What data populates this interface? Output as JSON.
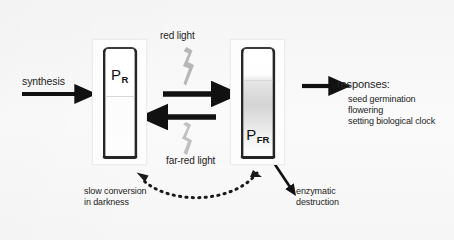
{
  "figure": {
    "background_color": "#f7f7f7"
  },
  "labels": {
    "synthesis": "synthesis",
    "red_light": "red light",
    "far_red_light": "far-red light",
    "slow_conversion_line1": "slow conversion",
    "slow_conversion_line2": "in darkness",
    "enzymatic_line1": "enzymatic",
    "enzymatic_line2": "destruction",
    "responses_heading": "responses:",
    "responses_items": [
      "seed germination",
      "flowering",
      "setting biological clock"
    ]
  },
  "tubes": [
    {
      "id": "pr",
      "symbol": "P",
      "subscript": "R",
      "name": "phytochrome-red-tube"
    },
    {
      "id": "pfr",
      "symbol": "P",
      "subscript": "FR",
      "name": "phytochrome-far-red-tube"
    }
  ],
  "colors": {
    "arrow": "#111111",
    "light_bolt": "#b4b4b4",
    "tube_outline": "#262626",
    "dashed_arrow": "#1a1a1a",
    "text": "#232323"
  }
}
